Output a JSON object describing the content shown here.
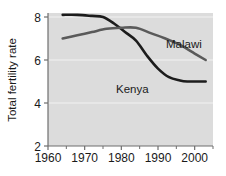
{
  "chart_data": {
    "type": "line",
    "title": "",
    "xlabel": "",
    "ylabel": "Total fertility rate",
    "xlim": [
      1960,
      2005
    ],
    "ylim": [
      2,
      8
    ],
    "xticks": [
      1960,
      1970,
      1980,
      1990,
      2000
    ],
    "xtick_labels": [
      "1960",
      "1970",
      "1980",
      "1990",
      "2000"
    ],
    "xminorticks": [
      1965,
      1975,
      1985,
      1995,
      2005
    ],
    "yticks": [
      2,
      4,
      6,
      8
    ],
    "ytick_labels": [
      "2",
      "4",
      "6",
      "8"
    ],
    "grid": "horizontal-white-faint",
    "legend": "inline-labels",
    "plot_background": "#dcdcdc",
    "series": [
      {
        "name": "Kenya",
        "color": "#1c1c1c",
        "label_position": "below-line-right-center",
        "x": [
          1964,
          1968,
          1972,
          1975,
          1978,
          1981,
          1984,
          1987,
          1990,
          1993,
          1996,
          1998,
          2000,
          2003
        ],
        "values": [
          8.1,
          8.1,
          8.05,
          8.0,
          7.7,
          7.3,
          6.9,
          6.2,
          5.6,
          5.2,
          5.05,
          5.0,
          5.0,
          5.0
        ]
      },
      {
        "name": "Malawi",
        "color": "#5a5a5a",
        "label_position": "above-line-right",
        "x": [
          1964,
          1968,
          1972,
          1976,
          1980,
          1984,
          1988,
          1992,
          1996,
          2000,
          2003
        ],
        "values": [
          7.0,
          7.15,
          7.3,
          7.45,
          7.5,
          7.5,
          7.25,
          7.0,
          6.7,
          6.3,
          6.0
        ]
      }
    ]
  },
  "labels": {
    "kenya": "Kenya",
    "malawi": "Malawi",
    "y_axis_title": "Total fertility rate"
  }
}
